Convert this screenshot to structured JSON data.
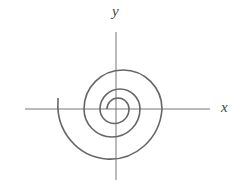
{
  "diagram": {
    "title": "",
    "axes": {
      "x_label": "x",
      "y_label": "y",
      "origin_px": [
        116,
        109
      ]
    },
    "curve": {
      "type": "spiral",
      "direction": "counterclockwise outward",
      "color": "#666666"
    },
    "colors": {
      "axis": "#777777",
      "curve": "#666666",
      "background": "#ffffff"
    }
  }
}
